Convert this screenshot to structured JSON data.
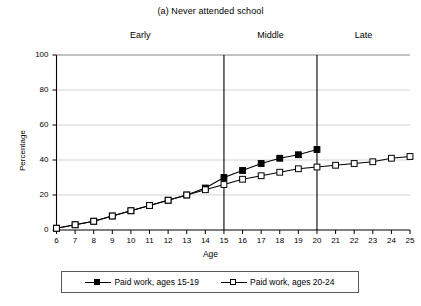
{
  "chart_data": {
    "type": "line",
    "title": "(a) Never attended school",
    "xlabel": "Age",
    "ylabel": "Percentage",
    "xlim": [
      6,
      25
    ],
    "ylim": [
      0,
      100
    ],
    "ytick_values": [
      0,
      20,
      40,
      60,
      80,
      100
    ],
    "xtick_values": [
      6,
      7,
      8,
      9,
      10,
      11,
      12,
      13,
      14,
      15,
      16,
      17,
      18,
      19,
      20,
      21,
      22,
      23,
      24,
      25
    ],
    "grid": "horizontal",
    "legend_position": "bottom",
    "phase_dividers": [
      15,
      20
    ],
    "phases": [
      {
        "label": "Early",
        "center_age": 10.5
      },
      {
        "label": "Middle",
        "center_age": 17.5
      },
      {
        "label": "Late",
        "center_age": 22.5
      }
    ],
    "series": [
      {
        "name": "Paid work, ages 15-19",
        "marker": "filled-square",
        "x": [
          6,
          7,
          8,
          9,
          10,
          11,
          12,
          13,
          14,
          15,
          16,
          17,
          18,
          19,
          20
        ],
        "values": [
          1,
          3,
          5,
          8,
          11,
          14,
          17,
          20,
          24,
          30,
          34,
          38,
          41,
          43,
          46
        ]
      },
      {
        "name": "Paid work, ages 20-24",
        "marker": "open-square",
        "x": [
          6,
          7,
          8,
          9,
          10,
          11,
          12,
          13,
          14,
          15,
          16,
          17,
          18,
          19,
          20,
          21,
          22,
          23,
          24,
          25
        ],
        "values": [
          1,
          3,
          5,
          8,
          11,
          14,
          17,
          20,
          23,
          26,
          29,
          31,
          33,
          35,
          36,
          37,
          38,
          39,
          41,
          42
        ]
      }
    ]
  },
  "colors": {
    "axis": "#000000",
    "grid": "#c8c8c8",
    "series_filled": "#000000",
    "series_open": "#000000",
    "background": "#ffffff"
  }
}
